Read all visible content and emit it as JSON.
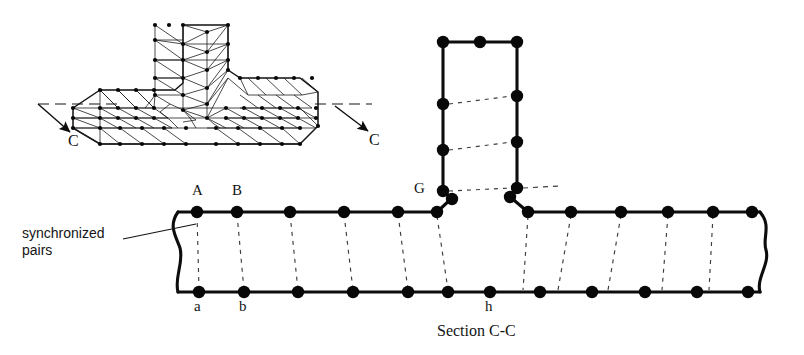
{
  "figure": {
    "caption": "Section C-C",
    "callout": {
      "line1": "synchronized",
      "line2": "pairs"
    },
    "section_marks": [
      {
        "id": "section-mark-left",
        "label": "C"
      },
      {
        "id": "section-mark-right",
        "label": "C"
      }
    ],
    "node_labels": {
      "top_left_first": "A",
      "top_left_second": "B",
      "top_fillet": "G",
      "bottom_left_first": "a",
      "bottom_left_second": "b",
      "bottom_center": "h"
    },
    "colors": {
      "outline": "#0d0d0d",
      "node_fill": "#080808",
      "mesh_line": "#1a1a1a",
      "dashed_pair": "#3a3a3a",
      "background": "#ffffff",
      "text": "#141414"
    },
    "geometry": {
      "section": {
        "flange_top_y": 212,
        "flange_bottom_y": 292,
        "left_break_x": 178,
        "right_break_x": 760,
        "web_left_x": 443,
        "web_right_x": 517,
        "web_top_y": 42
      },
      "flange_top_left_nodes_x": [
        197,
        237,
        290,
        344,
        398,
        437
      ],
      "flange_top_right_nodes_x": [
        528,
        571,
        621,
        668,
        713,
        752
      ],
      "flange_bottom_left_nodes_x": [
        197,
        237,
        290,
        344,
        398,
        444
      ],
      "flange_bottom_right_nodes_x": [
        490,
        540,
        592,
        645,
        697,
        748
      ],
      "web_left_nodes_y": [
        42,
        104,
        150,
        191
      ],
      "web_right_nodes_y": [
        42,
        96,
        142,
        188
      ],
      "web_top_nodes_x": [
        443,
        480,
        517
      ],
      "synchronized_pair_count": 14
    },
    "mesh_view": {
      "description": "3D triangulated T-section finite element mesh",
      "node_count_visible": 120
    }
  }
}
